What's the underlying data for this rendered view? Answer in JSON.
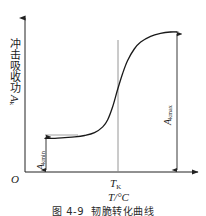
{
  "figure": {
    "caption_number": "图 4-9",
    "caption_title": "韧脆转化曲线",
    "origin_label": "O"
  },
  "axes": {
    "y_label_chinese": "冲击吸收功",
    "y_label_symbol": "A",
    "y_label_subscript": "k",
    "x_label_tick": "T",
    "x_label_tick_subscript": "K",
    "x_label_axis": "T/°C"
  },
  "annotations": {
    "akmin_symbol": "A",
    "akmin_subscript": "kmin",
    "akmax_symbol": "A",
    "akmax_subscript": "kmax"
  },
  "colors": {
    "curve": "#1a1a1a",
    "axis": "#222222",
    "guide": "#8a8a8a",
    "background": "#ffffff"
  },
  "chart_data": {
    "type": "line",
    "title": "韧脆转化曲线",
    "xlabel": "T/°C",
    "ylabel": "冲击吸收功 Ak",
    "grid": false,
    "legend": null,
    "xlim": [
      0,
      100
    ],
    "ylim": [
      0,
      100
    ],
    "series": [
      {
        "name": "冲击吸收功-温度曲线",
        "comment": "S-shaped ductile-to-brittle transition curve",
        "x": [
          20,
          26,
          32,
          38,
          44,
          50,
          55,
          58,
          61,
          64,
          67,
          70,
          74,
          78,
          84,
          90,
          96,
          100
        ],
        "y": [
          22,
          22,
          22.5,
          23,
          24,
          26,
          30,
          35,
          44,
          56,
          67,
          76,
          84,
          89,
          93,
          95,
          96,
          96
        ]
      }
    ],
    "markers": [
      {
        "name": "transition-temperature-line",
        "type": "vline",
        "x": 64,
        "label": "T_K",
        "y_from": 0,
        "y_to": 90
      },
      {
        "name": "akmin-dimension",
        "type": "double-arrow-vertical",
        "x": 22,
        "y_from": 0,
        "y_to": 22,
        "label": "A_kmin"
      },
      {
        "name": "akmax-dimension",
        "type": "double-arrow-vertical",
        "x": 100,
        "y_from": 0,
        "y_to": 96,
        "label": "A_kmax"
      }
    ]
  }
}
